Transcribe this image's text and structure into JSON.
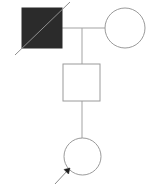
{
  "diagram": {
    "type": "pedigree-chart",
    "title": "",
    "canvas": {
      "width": 159,
      "height": 189,
      "background": "#ffffff"
    },
    "colors": {
      "affected_fill": "#2b2b2b",
      "unaffected_fill": "#ffffff",
      "symbol_stroke": "#9a9a9a",
      "affected_stroke": "#2b2b2b",
      "line_stroke": "#a3a3a3",
      "deceased_slash": "#8f8f8f",
      "proband_arrow": "#8a8a8a",
      "proband_arrowhead": "#1f1f1f"
    },
    "generations": [
      {
        "id": "generation-I",
        "label": "I",
        "members": [
          {
            "id": "I-1",
            "shape": "square",
            "sex": "male",
            "affected": true,
            "deceased": true,
            "proband": false,
            "fill": "#2b2b2b",
            "x": 22,
            "y": 8,
            "size": 40
          },
          {
            "id": "I-2",
            "shape": "circle",
            "sex": "female",
            "affected": false,
            "deceased": false,
            "proband": false,
            "fill": "#ffffff",
            "cx": 125,
            "cy": 28,
            "r": 20
          }
        ]
      },
      {
        "id": "generation-II",
        "label": "II",
        "members": [
          {
            "id": "II-1",
            "shape": "square",
            "sex": "male",
            "affected": false,
            "deceased": false,
            "proband": false,
            "fill": "#ffffff",
            "x": 63,
            "y": 64,
            "size": 37
          }
        ]
      },
      {
        "id": "generation-III",
        "label": "III",
        "members": [
          {
            "id": "III-1",
            "shape": "circle",
            "sex": "female",
            "affected": false,
            "deceased": false,
            "proband": true,
            "fill": "#ffffff",
            "cx": 82.5,
            "cy": 156.5,
            "r": 18.5
          }
        ]
      }
    ],
    "connectors": {
      "mating_line": {
        "x1": 62,
        "y1": 28,
        "x2": 105,
        "y2": 28
      },
      "sibship_drop_1": {
        "x1": 82,
        "y1": 28,
        "x2": 82,
        "y2": 64
      },
      "sibship_drop_2": {
        "x1": 82,
        "y1": 101,
        "x2": 82,
        "y2": 138
      }
    },
    "markers": {
      "deceased_slash": {
        "x1": 15,
        "y1": 55,
        "x2": 70,
        "y2": 2
      },
      "proband_arrow": {
        "x1": 55,
        "y1": 184,
        "x2": 68,
        "y2": 170,
        "head_x": 69,
        "head_y": 169,
        "head_size": 4
      }
    }
  }
}
